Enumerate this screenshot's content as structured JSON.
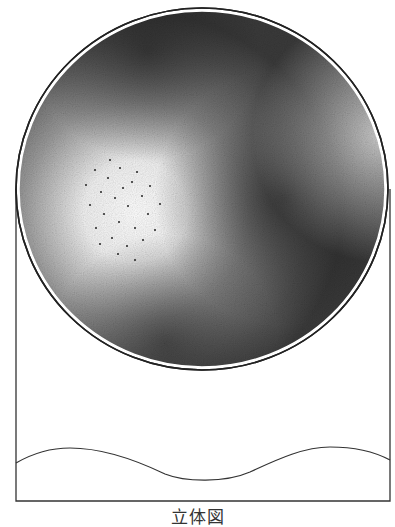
{
  "figure": {
    "caption": "立体図",
    "colors": {
      "stroke": "#333333",
      "stipple_dark": "#1a1a1a",
      "background": "#ffffff"
    },
    "sphere": {
      "cx": 202,
      "cy": 189,
      "rx": 186,
      "ry": 181
    },
    "frame": {
      "left": 16,
      "right": 390,
      "bottom": 501
    },
    "wave": {
      "label": "wavy-baseline"
    }
  }
}
